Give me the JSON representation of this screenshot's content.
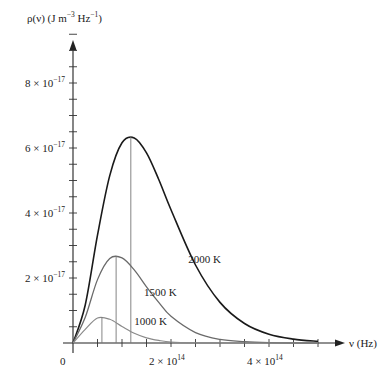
{
  "chart_data": {
    "type": "line",
    "title": "",
    "ylabel": "ρ(ν) (J m⁻³ Hz⁻¹)",
    "ylabel_parts": {
      "main": "ρ(ν) (J m",
      "sup1": "−3",
      "mid": " Hz",
      "sup2": "−1",
      "end": ")"
    },
    "xlabel": "ν (Hz)",
    "x_unit": 100000000000000.0,
    "y_unit": 1e-17,
    "xlim": [
      0,
      5.5
    ],
    "ylim": [
      0,
      10
    ],
    "x_ticks_major": [
      {
        "value": 2,
        "label_mant": "2 × 10",
        "label_exp": "14"
      },
      {
        "value": 4,
        "label_mant": "4 × 10",
        "label_exp": "14"
      }
    ],
    "y_ticks_major": [
      {
        "value": 2,
        "label_mant": "2 × 10",
        "label_exp": "−17"
      },
      {
        "value": 4,
        "label_mant": "4 × 10",
        "label_exp": "−17"
      },
      {
        "value": 6,
        "label_mant": "6 × 10",
        "label_exp": "−17"
      },
      {
        "value": 8,
        "label_mant": "8 × 10",
        "label_exp": "−17"
      }
    ],
    "origin_label": "0",
    "minor_tick_step_x": 0.5,
    "minor_tick_step_y": 0.5,
    "grid": false,
    "x": [
      0,
      0.25,
      0.5,
      0.75,
      1.0,
      1.25,
      1.5,
      1.75,
      2.0,
      2.5,
      3.0,
      3.5,
      4.0,
      4.5,
      5.0
    ],
    "series": [
      {
        "name": "2000 K",
        "T": 2000,
        "color": "#1a1a1a",
        "width": 1.6,
        "peak": {
          "x": 1.18,
          "y": 6.37
        },
        "values": [
          0,
          1.17,
          3.32,
          5.15,
          6.16,
          6.31,
          5.85,
          5.03,
          4.1,
          2.4,
          1.25,
          0.6,
          0.27,
          0.12,
          0.05
        ]
      },
      {
        "name": "1500 K",
        "T": 1500,
        "color": "#6a6a6a",
        "width": 1.3,
        "peak": {
          "x": 0.88,
          "y": 2.68
        },
        "values": [
          0,
          0.79,
          1.95,
          2.6,
          2.62,
          2.25,
          1.73,
          1.25,
          0.82,
          0.32,
          0.11,
          0.04,
          0.01,
          0.0,
          0.0
        ]
      },
      {
        "name": "1000 K",
        "T": 1000,
        "color": "#8a8a8a",
        "width": 1.2,
        "peak": {
          "x": 0.59,
          "y": 0.8
        },
        "values": [
          0,
          0.42,
          0.77,
          0.73,
          0.51,
          0.3,
          0.16,
          0.08,
          0.03,
          0.006,
          0.001,
          0.0,
          0.0,
          0.0,
          0.0
        ]
      }
    ],
    "annotations": [
      {
        "text": "2000 K",
        "x": 2.35,
        "y": 2.45
      },
      {
        "text": "1500 K",
        "x": 1.45,
        "y": 1.45
      },
      {
        "text": "1000 K",
        "x": 1.25,
        "y": 0.55
      }
    ]
  }
}
